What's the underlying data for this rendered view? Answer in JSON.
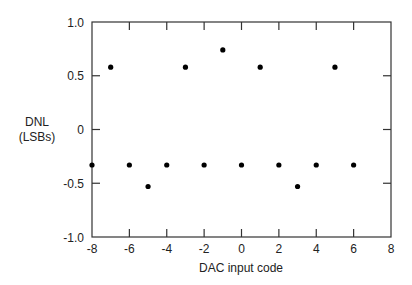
{
  "chart_data": {
    "type": "scatter",
    "title": "",
    "xlabel": "DAC input code",
    "ylabel_lines": [
      "DNL",
      "(LSBs)"
    ],
    "xlim": [
      -8,
      8
    ],
    "ylim": [
      -1.0,
      1.0
    ],
    "xticks": [
      -8,
      -6,
      -4,
      -2,
      0,
      2,
      4,
      6,
      8
    ],
    "xtick_labels": [
      "-8",
      "-6",
      "-4",
      "-2",
      "0",
      "2",
      "4",
      "6",
      "8"
    ],
    "yticks": [
      -1.0,
      -0.5,
      0,
      0.5,
      1.0
    ],
    "ytick_labels": [
      "-1.0",
      "-0.5",
      "0",
      "0.5",
      "1.0"
    ],
    "grid": false,
    "legend": null,
    "series": [
      {
        "name": "DNL",
        "x": [
          -8,
          -7,
          -6,
          -5,
          -4,
          -3,
          -2,
          -1,
          0,
          1,
          2,
          3,
          4,
          5,
          6
        ],
        "y": [
          -0.33,
          0.58,
          -0.33,
          -0.53,
          -0.33,
          0.58,
          -0.33,
          0.74,
          -0.33,
          0.58,
          -0.33,
          -0.53,
          -0.33,
          0.58,
          -0.33
        ]
      }
    ]
  }
}
